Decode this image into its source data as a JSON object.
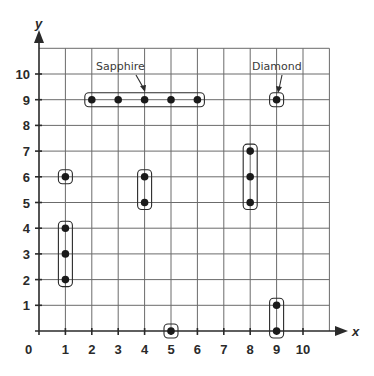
{
  "chart_data": {
    "type": "scatter",
    "title": "",
    "xlabel": "x",
    "ylabel": "y",
    "xlim": [
      0,
      11
    ],
    "ylim": [
      0,
      11
    ],
    "grid": true,
    "origin_label": "0",
    "x_ticks": [
      "1",
      "2",
      "3",
      "4",
      "5",
      "6",
      "7",
      "8",
      "9",
      "10"
    ],
    "y_ticks": [
      "1",
      "2",
      "3",
      "4",
      "5",
      "6",
      "7",
      "8",
      "9",
      "10"
    ],
    "points": [
      {
        "x": 1,
        "y": 2
      },
      {
        "x": 1,
        "y": 3
      },
      {
        "x": 1,
        "y": 4
      },
      {
        "x": 1,
        "y": 6
      },
      {
        "x": 2,
        "y": 9
      },
      {
        "x": 3,
        "y": 9
      },
      {
        "x": 4,
        "y": 9
      },
      {
        "x": 5,
        "y": 9
      },
      {
        "x": 6,
        "y": 9
      },
      {
        "x": 4,
        "y": 5
      },
      {
        "x": 4,
        "y": 6
      },
      {
        "x": 5,
        "y": 0
      },
      {
        "x": 8,
        "y": 5
      },
      {
        "x": 8,
        "y": 6
      },
      {
        "x": 8,
        "y": 7
      },
      {
        "x": 9,
        "y": 0
      },
      {
        "x": 9,
        "y": 1
      },
      {
        "x": 9,
        "y": 9
      }
    ],
    "groups": [
      {
        "name": "group-1-2to4",
        "points": [
          [
            1,
            2
          ],
          [
            1,
            3
          ],
          [
            1,
            4
          ]
        ]
      },
      {
        "name": "group-1-6",
        "points": [
          [
            1,
            6
          ]
        ]
      },
      {
        "name": "Sapphire",
        "points": [
          [
            2,
            9
          ],
          [
            3,
            9
          ],
          [
            4,
            9
          ],
          [
            5,
            9
          ],
          [
            6,
            9
          ]
        ]
      },
      {
        "name": "group-4-5to6",
        "points": [
          [
            4,
            5
          ],
          [
            4,
            6
          ]
        ]
      },
      {
        "name": "group-5-0",
        "points": [
          [
            5,
            0
          ]
        ]
      },
      {
        "name": "group-8-5to7",
        "points": [
          [
            8,
            5
          ],
          [
            8,
            6
          ],
          [
            8,
            7
          ]
        ]
      },
      {
        "name": "group-9-0to1",
        "points": [
          [
            9,
            0
          ],
          [
            9,
            1
          ]
        ]
      },
      {
        "name": "Diamond",
        "points": [
          [
            9,
            9
          ]
        ]
      }
    ],
    "annotations": [
      {
        "text": "Sapphire",
        "points_to": [
          4,
          9
        ]
      },
      {
        "text": "Diamond",
        "points_to": [
          9,
          9
        ]
      }
    ]
  },
  "labels": {
    "sapphire": "Sapphire",
    "diamond": "Diamond",
    "x_axis": "x",
    "y_axis": "y",
    "origin": "0"
  },
  "colors": {
    "grid": "#6b6b6b",
    "axis": "#2a2a2a",
    "point": "#1a1a1a"
  }
}
